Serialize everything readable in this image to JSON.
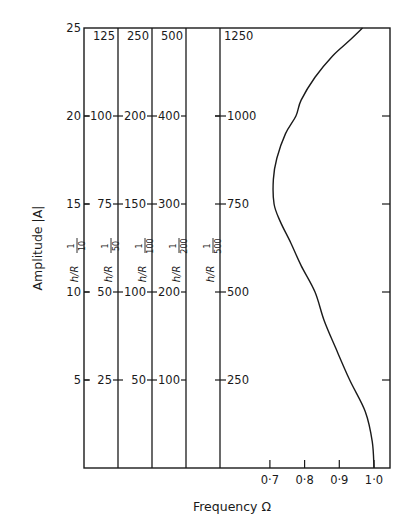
{
  "chart_data": {
    "type": "line",
    "title": "",
    "xlabel": "Frequency Ω",
    "ylabel": "Amplitude |A|",
    "x_ticks": [
      "0·7",
      "0·8",
      "0·9",
      "1·0"
    ],
    "x_tick_values": [
      0.7,
      0.8,
      0.9,
      1.0
    ],
    "ylim": [
      0,
      25
    ],
    "xlim_visible": [
      0.66,
      1.046
    ],
    "grid": false,
    "legend": null,
    "y_scales": [
      {
        "name": "A",
        "hr_label": "",
        "ticks": [
          "5",
          "10",
          "15",
          "20",
          "25"
        ]
      },
      {
        "name": "h/R 1/10",
        "hr_label": "h/R",
        "hr_denominator": "10",
        "ticks": [
          "25",
          "50",
          "75",
          "100",
          "125"
        ]
      },
      {
        "name": "h/R 1/50",
        "hr_label": "h/R",
        "hr_denominator": "50",
        "ticks": [
          "50",
          "100",
          "150",
          "200",
          "250"
        ]
      },
      {
        "name": "h/R 1/100",
        "hr_label": "h/R",
        "hr_denominator": "100",
        "ticks": [
          "100",
          "200",
          "300",
          "400",
          "500"
        ]
      },
      {
        "name": "h/R 1/200",
        "hr_label": "h/R",
        "hr_denominator": "200",
        "ticks": [
          "",
          "",
          "",
          "",
          ""
        ]
      },
      {
        "name": "h/R 1/500",
        "hr_label": "h/R",
        "hr_denominator": "500",
        "ticks": [
          "250",
          "500",
          "750",
          "1000",
          "1250"
        ]
      }
    ],
    "series": [
      {
        "name": "backbone curve",
        "x": [
          1.0,
          0.995,
          0.975,
          0.93,
          0.89,
          0.856,
          0.83,
          0.79,
          0.76,
          0.73,
          0.712,
          0.71,
          0.72,
          0.745,
          0.775,
          0.79,
          0.83,
          0.88,
          0.93,
          0.967
        ],
        "y": [
          0,
          1.5,
          3.2,
          5,
          6.8,
          8.4,
          10,
          11.5,
          12.8,
          14,
          15,
          16.4,
          17.6,
          19,
          20,
          20.9,
          22.2,
          23.4,
          24.3,
          25
        ]
      }
    ]
  },
  "labels": {
    "y_title": "Amplitude |A|",
    "x_title": "Frequency Ω",
    "hr_prefix": "h/R",
    "hr_numerator": "1"
  }
}
